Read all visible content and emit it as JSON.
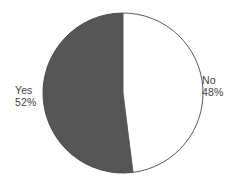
{
  "chart_data": {
    "type": "pie",
    "title": "",
    "subtitle": "",
    "xlabel": "",
    "ylabel": "",
    "grid": false,
    "legend": "none",
    "labels_position": "outside",
    "start_angle_deg": 0,
    "direction": "counterclockwise",
    "categories": [
      "Yes",
      "No"
    ],
    "values": [
      52,
      48
    ],
    "value_unit": "%",
    "slices": [
      {
        "label": "Yes",
        "value": 52,
        "value_text": "52%",
        "color": "#565656",
        "outline": "#4a4a4a"
      },
      {
        "label": "No",
        "value": 48,
        "value_text": "48%",
        "color": "#ffffff",
        "outline": "#5a5a5a"
      }
    ]
  },
  "geometry": {
    "center_x": 123,
    "center_y": 93,
    "radius": 80
  },
  "colors": {
    "background": "#ffffff",
    "text": "#434343",
    "slice_dark": "#565656",
    "slice_light": "#ffffff",
    "outline": "#555555"
  }
}
